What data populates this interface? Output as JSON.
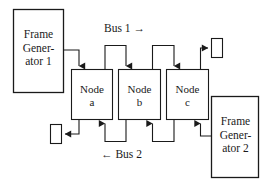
{
  "diagram": {
    "stroke_color": "#1a1a1a",
    "background_color": "#ffffff",
    "buses": [
      {
        "id": "bus1",
        "label": "Bus 1 →",
        "direction": "left-to-right"
      },
      {
        "id": "bus2",
        "label": "← Bus 2",
        "direction": "right-to-left"
      }
    ],
    "generators": [
      {
        "id": "fg1",
        "label": "Frame\nGener-\nator 1"
      },
      {
        "id": "fg2",
        "label": "Frame\nGener-\nator 2"
      }
    ],
    "nodes": [
      {
        "id": "node-a",
        "label": "Node\na"
      },
      {
        "id": "node-b",
        "label": "Node\nb"
      },
      {
        "id": "node-c",
        "label": "Node\nc"
      }
    ],
    "terminators": [
      {
        "id": "terminator-top-right",
        "label": ""
      },
      {
        "id": "terminator-bottom-left",
        "label": ""
      }
    ]
  }
}
